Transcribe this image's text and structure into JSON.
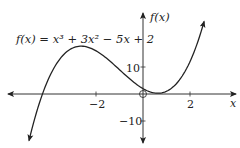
{
  "formula_label": "f(x) = x³ + 3x² − 5x + 2",
  "axes": {
    "x_label": "x",
    "y_label": "f(x)",
    "x_ticks": [
      {
        "value": -2,
        "label": "−2"
      },
      {
        "value": 2,
        "label": "2"
      }
    ],
    "y_ticks": [
      {
        "value": 10,
        "label": "10"
      },
      {
        "value": -10,
        "label": "−10"
      }
    ]
  },
  "origin_marker": "open-circle",
  "colors": {
    "curve": "#222222",
    "axes": "#333333",
    "background": "#ffffff"
  },
  "chart_data": {
    "type": "line",
    "xlabel": "x",
    "ylabel": "f(x)",
    "function": "x^3 + 3x^2 - 5x + 2",
    "xlim": [
      -6,
      4
    ],
    "ylim": [
      -18,
      30
    ],
    "x_ticks": [
      -2,
      2
    ],
    "y_ticks": [
      -10,
      10
    ],
    "grid": false,
    "series": [
      {
        "name": "f(x)",
        "x": [
          -4.85,
          -4.5,
          -4,
          -3.5,
          -3,
          -2.63,
          -2,
          -1.5,
          -1,
          -0.5,
          0,
          0.5,
          0.63,
          1,
          1.5,
          2,
          2.6
        ],
        "values": [
          -17.3,
          -5.9,
          6,
          12.6,
          17,
          17.1,
          16,
          13.6,
          9,
          5.1,
          2,
          0.4,
          0.3,
          1,
          4.1,
          12,
          26.9
        ]
      }
    ],
    "annotations": [
      {
        "type": "open-circle",
        "x": 0,
        "y": 0
      },
      {
        "type": "local-max",
        "x": -2.63,
        "y": 17.06
      },
      {
        "type": "local-min",
        "x": 0.63,
        "y": 0.3
      }
    ]
  }
}
